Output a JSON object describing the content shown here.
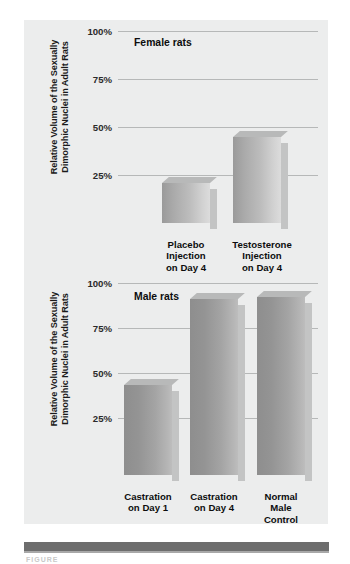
{
  "figure": {
    "background_color": "#eceded",
    "rule_color": "#6d6d6d",
    "caption": "FIGURE"
  },
  "chart_data": [
    {
      "type": "bar",
      "id": "female-rats",
      "title": "Female rats",
      "ylabel": "Relative Volume of the Sexually\nDimorphic Nuclei in Adult Rats",
      "xlabel": "",
      "categories": [
        "Placebo\nInjection\non Day 4",
        "Testosterone\nInjection\non Day 4"
      ],
      "values": [
        21,
        45
      ],
      "ylim": [
        0,
        100
      ],
      "yticks": [
        25,
        50,
        75,
        100
      ],
      "ytick_labels": [
        "25%",
        "50%",
        "75%",
        "100%"
      ],
      "grid": true,
      "legend": "none"
    },
    {
      "type": "bar",
      "id": "male-rats",
      "title": "Male rats",
      "ylabel": "Relative Volume of the Sexually\nDimorphic Nuclei in Adult Rats",
      "xlabel": "",
      "categories": [
        "Castration\non Day 1",
        "Castration\non Day 4",
        "Normal\nMale\nControl"
      ],
      "values": [
        50,
        98,
        99
      ],
      "ylim": [
        0,
        100
      ],
      "yticks": [
        25,
        50,
        75,
        100
      ],
      "ytick_labels": [
        "25%",
        "50%",
        "75%",
        "100%"
      ],
      "grid": true,
      "legend": "none"
    }
  ]
}
